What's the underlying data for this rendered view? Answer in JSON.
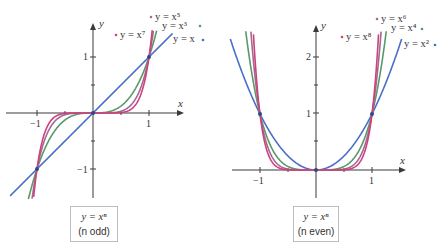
{
  "chart_data": [
    {
      "type": "line",
      "title": "y = x^n (n odd)",
      "caption": {
        "equation": "y = xⁿ",
        "note": "(n odd)"
      },
      "xlabel": "x",
      "ylabel": "y",
      "xlim": [
        -1.5,
        1.5
      ],
      "ylim": [
        -1.5,
        1.5
      ],
      "x_ticks": [
        -1,
        1
      ],
      "x_tick_labels": [
        "−1",
        "1"
      ],
      "y_ticks": [
        -1,
        1
      ],
      "y_tick_labels": [
        "−1",
        "1"
      ],
      "minor_ticks": [
        -0.5,
        0.5
      ],
      "grid": false,
      "marked_points": [
        [
          -1,
          -1
        ],
        [
          0,
          0
        ],
        [
          1,
          1
        ]
      ],
      "series": [
        {
          "name": "y = x",
          "exponent": 1,
          "color": "#4a6fc9",
          "label": "y = x"
        },
        {
          "name": "y = x^3",
          "exponent": 3,
          "color": "#5a9a66",
          "label": "y = x³"
        },
        {
          "name": "y = x^5",
          "exponent": 5,
          "color": "#a06a9a",
          "label": "y = x⁵"
        },
        {
          "name": "y = x^7",
          "exponent": 7,
          "color": "#d0407a",
          "label": "y = x⁷"
        }
      ]
    },
    {
      "type": "line",
      "title": "y = x^n (n even)",
      "caption": {
        "equation": "y = xⁿ",
        "note": "(n even)"
      },
      "xlabel": "x",
      "ylabel": "y",
      "xlim": [
        -1.5,
        1.5
      ],
      "ylim": [
        -0.5,
        2.5
      ],
      "x_ticks": [
        -1,
        1
      ],
      "x_tick_labels": [
        "−1",
        "1"
      ],
      "y_ticks": [
        1,
        2
      ],
      "y_tick_labels": [
        "1",
        "2"
      ],
      "minor_ticks": [
        -0.5,
        0.5
      ],
      "grid": false,
      "marked_points": [
        [
          -1,
          1
        ],
        [
          0,
          0
        ],
        [
          1,
          1
        ]
      ],
      "series": [
        {
          "name": "y = x^2",
          "exponent": 2,
          "color": "#4a6fc9",
          "label": "y = x²"
        },
        {
          "name": "y = x^4",
          "exponent": 4,
          "color": "#5a9a66",
          "label": "y = x⁴"
        },
        {
          "name": "y = x^6",
          "exponent": 6,
          "color": "#a06a9a",
          "label": "y = x⁶"
        },
        {
          "name": "y = x^8",
          "exponent": 8,
          "color": "#d0407a",
          "label": "y = x⁸"
        }
      ]
    }
  ],
  "captions": {
    "left": {
      "equation": "y = xⁿ",
      "note": "(n odd)"
    },
    "right": {
      "equation": "y = xⁿ",
      "note": "(n even)"
    }
  }
}
